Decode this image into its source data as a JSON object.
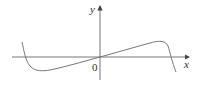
{
  "figure": {
    "type": "function-graph",
    "axes": {
      "x_label": "x",
      "y_label": "y",
      "origin_label": "0"
    },
    "colors": {
      "axis": "#555555",
      "curve": "#777777",
      "text": "#333333"
    }
  }
}
